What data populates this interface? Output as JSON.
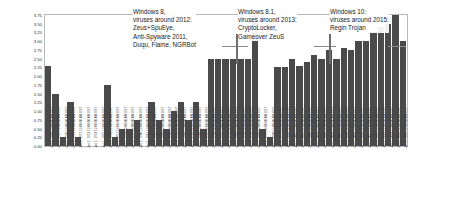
{
  "chart_data": {
    "type": "bar",
    "title": "",
    "xlabel": "",
    "ylabel": "Frequency",
    "ylim": [
      0.0,
      3.75
    ],
    "grid": false,
    "legend": "none",
    "ytick_labels": [
      "3.75",
      "3.50",
      "3.25",
      "3.00",
      "2.75",
      "2.50",
      "2.25",
      "2.00",
      "1.75",
      "1.50",
      "1.25",
      "1.00",
      "0.75",
      "0.50",
      "0.25",
      "0.00"
    ],
    "ytick_values": [
      3.75,
      3.5,
      3.25,
      3.0,
      2.75,
      2.5,
      2.25,
      2.0,
      1.75,
      1.5,
      1.25,
      1.0,
      0.75,
      0.5,
      0.25,
      0.0
    ],
    "categories": [
      "Jan 1, 1968 12:00:00 AM EST",
      "Jan 1, 1969 12:00:00 AM EST",
      "Jan 1, 1970 12:00:00 AM EST",
      "Jan 1, 1971 12:00:00 AM EST",
      "Jan 1, 1972 12:00:00 AM EST",
      "Jan 1, 1973 12:00:00 AM EST",
      "Jan 1, 1974 12:00:00 AM EST",
      "Jan 1, 1975 12:00:00 AM EST",
      "Jan 1, 1976 12:00:00 AM EST",
      "Jan 1, 1977 12:00:00 AM EST",
      "Jan 1, 1978 12:00:00 AM EST",
      "Jan 1, 1979 12:00:00 AM EST",
      "Jan 1, 1980 12:00:00 AM EST",
      "Jan 1, 1981 12:00:00 AM EST",
      "Jan 1, 1982 12:00:00 AM EST",
      "Jan 1, 1983 12:00:00 AM EST",
      "Jan 1, 1984 12:00:00 AM EST",
      "Jan 1, 1985 12:00:00 AM EST",
      "Jan 1, 1986 12:00:00 AM EST",
      "Jan 1, 1987 12:00:00 AM EST",
      "Jan 1, 1988 12:00:00 AM EST",
      "Jan 1, 1989 12:00:00 AM EST",
      "Jan 1, 1990 12:00:00 AM EST",
      "Jan 1, 1991 12:00:00 AM EST",
      "Jan 1, 1992 12:00:00 AM EST",
      "Jan 1, 1993 12:00:00 AM EST",
      "Jan 1, 1994 12:00:00 AM EST",
      "Jan 1, 1995 12:00:00 AM EST",
      "Jan 1, 1996 12:00:00 AM EST",
      "Jan 1, 1997 12:00:00 AM EST",
      "Jan 1, 1998 12:00:00 AM EST",
      "Jan 1, 1999 12:00:00 AM EST",
      "Jan 1, 2000 12:00:00 AM EST",
      "Jan 1, 2001 12:00:00 AM EST",
      "Jan 1, 2002 12:00:00 AM EST",
      "Jan 1, 2003 12:00:00 AM EST",
      "Jan 1, 2004 12:00:00 AM EST",
      "Jan 1, 2005 12:00:00 AM EST",
      "Jan 1, 2006 12:00:00 AM EST",
      "Jan 1, 2007 12:00:00 AM EST",
      "Jan 1, 2008 12:00:00 AM EST",
      "Jan 1, 2009 12:00:00 AM EST",
      "Jan 1, 2010 12:00:00 AM EST",
      "Jan 1, 2011 12:00:00 AM EST",
      "Jan 1, 2012 12:00:00 AM EST",
      "Jan 1, 2013 12:00:00 AM EST",
      "Jan 1, 2014 12:00:00 AM EST",
      "Jan 1, 2015 12:00:00 AM EST",
      "Jan 1, 2016 12:00:00 AM EST"
    ],
    "values": [
      2.3,
      1.5,
      0.25,
      1.25,
      0.25,
      0.0,
      0.0,
      0.0,
      1.75,
      0.25,
      0.5,
      0.5,
      0.75,
      0.0,
      1.25,
      0.75,
      0.5,
      1.0,
      1.25,
      0.75,
      1.25,
      0.5,
      2.5,
      2.5,
      2.5,
      2.5,
      2.5,
      2.5,
      3.75,
      0.5,
      0.25,
      2.25,
      2.25,
      2.5,
      2.3,
      2.4,
      2.6,
      2.5,
      2.75,
      2.5,
      2.8,
      2.75,
      3.0,
      3.0,
      3.25,
      3.4,
      3.5,
      3.75,
      3.0
    ],
    "bar_color": "#4a4a4a",
    "annotations": [
      {
        "id": "annot-0",
        "text": "Windows 8,\nviruses around 2012:\nZeus+SpuEye,\nAnti-Spyware 2011,\nDuqu, Flame, NGRBot"
      },
      {
        "id": "annot-1",
        "text": "Windows 8.1,\nviruses around 2013:\nCryptoLocker,\nGameover ZeuS"
      },
      {
        "id": "annot-2",
        "text": "Windows 10:\nviruses around 2015:\nRegin Trojan"
      }
    ]
  }
}
